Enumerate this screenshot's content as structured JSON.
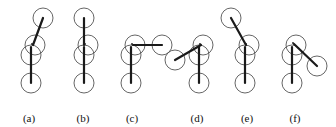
{
  "figure": {
    "kind": "multi-panel-line-diagram",
    "background_color": "#ffffff",
    "stroke_color": "#1a1a1a",
    "circle_stroke_color": "#555555",
    "circle_fill": "none",
    "width": 336,
    "height": 127,
    "label_row_y": 112,
    "circle_radius": 10,
    "link_stroke_width": 2.2,
    "circle_stroke_width": 0.9,
    "joint_dot_radius": 0.9,
    "panels": [
      {
        "label": "(a)",
        "label_x": 22,
        "distal_direction_label": "upper-right",
        "distal_angle_deg": 62,
        "base_circle": {
          "cx": 31,
          "cy": 83,
          "r": 10
        },
        "mid_lower_circle": {
          "cx": 31,
          "cy": 55,
          "r": 10
        },
        "mid_upper_circle": {
          "cx": 35,
          "cy": 45,
          "r": 10
        },
        "distal_circle": {
          "cx": 43,
          "cy": 18,
          "r": 10
        },
        "links": [
          {
            "x1": 31,
            "y1": 83,
            "x2": 31,
            "y2": 47
          },
          {
            "x1": 33,
            "y1": 45,
            "x2": 43,
            "y2": 18
          }
        ],
        "joint_dot": {
          "cx": 32,
          "cy": 44
        }
      },
      {
        "label": "(b)",
        "label_x": 76,
        "distal_direction_label": "straight-up",
        "distal_angle_deg": 90,
        "base_circle": {
          "cx": 84,
          "cy": 83,
          "r": 10
        },
        "mid_lower_circle": {
          "cx": 84,
          "cy": 55,
          "r": 10
        },
        "mid_upper_circle": {
          "cx": 88,
          "cy": 45,
          "r": 10
        },
        "distal_circle": {
          "cx": 84,
          "cy": 18,
          "r": 10
        },
        "links": [
          {
            "x1": 84,
            "y1": 83,
            "x2": 84,
            "y2": 47
          },
          {
            "x1": 84,
            "y1": 45,
            "x2": 84,
            "y2": 18
          }
        ],
        "joint_dot": {
          "cx": 85,
          "cy": 44
        }
      },
      {
        "label": "(c)",
        "label_x": 125,
        "distal_direction_label": "horizontal-right",
        "distal_angle_deg": 0,
        "base_circle": {
          "cx": 131,
          "cy": 83,
          "r": 10
        },
        "mid_lower_circle": {
          "cx": 131,
          "cy": 55,
          "r": 10
        },
        "mid_upper_circle": {
          "cx": 135,
          "cy": 45,
          "r": 10
        },
        "distal_circle": {
          "cx": 162,
          "cy": 45,
          "r": 10
        },
        "links": [
          {
            "x1": 131,
            "y1": 83,
            "x2": 131,
            "y2": 47
          },
          {
            "x1": 133,
            "y1": 45,
            "x2": 162,
            "y2": 45
          }
        ],
        "joint_dot": {
          "cx": 132,
          "cy": 44
        }
      },
      {
        "label": "(d)",
        "label_x": 190,
        "distal_direction_label": "lower-left",
        "distal_angle_deg": 205,
        "base_circle": {
          "cx": 199,
          "cy": 83,
          "r": 10
        },
        "mid_lower_circle": {
          "cx": 199,
          "cy": 55,
          "r": 10
        },
        "mid_upper_circle": {
          "cx": 203,
          "cy": 45,
          "r": 10
        },
        "distal_circle": {
          "cx": 175,
          "cy": 60,
          "r": 10
        },
        "links": [
          {
            "x1": 199,
            "y1": 83,
            "x2": 199,
            "y2": 47
          },
          {
            "x1": 201,
            "y1": 45,
            "x2": 175,
            "y2": 60
          }
        ],
        "joint_dot": {
          "cx": 200,
          "cy": 44
        }
      },
      {
        "label": "(e)",
        "label_x": 240,
        "distal_direction_label": "upper-left",
        "distal_angle_deg": 118,
        "base_circle": {
          "cx": 245,
          "cy": 83,
          "r": 10
        },
        "mid_lower_circle": {
          "cx": 245,
          "cy": 55,
          "r": 10
        },
        "mid_upper_circle": {
          "cx": 249,
          "cy": 45,
          "r": 10
        },
        "distal_circle": {
          "cx": 231,
          "cy": 18,
          "r": 10
        },
        "links": [
          {
            "x1": 245,
            "y1": 83,
            "x2": 245,
            "y2": 47
          },
          {
            "x1": 246,
            "y1": 45,
            "x2": 231,
            "y2": 18
          }
        ],
        "joint_dot": {
          "cx": 246,
          "cy": 44
        }
      },
      {
        "label": "(f)",
        "label_x": 288,
        "distal_direction_label": "lower-right",
        "distal_angle_deg": -40,
        "base_circle": {
          "cx": 292,
          "cy": 83,
          "r": 10
        },
        "mid_lower_circle": {
          "cx": 292,
          "cy": 55,
          "r": 10
        },
        "mid_upper_circle": {
          "cx": 296,
          "cy": 45,
          "r": 10
        },
        "distal_circle": {
          "cx": 317,
          "cy": 66,
          "r": 10
        },
        "links": [
          {
            "x1": 292,
            "y1": 83,
            "x2": 292,
            "y2": 47
          },
          {
            "x1": 294,
            "y1": 44,
            "x2": 317,
            "y2": 66
          }
        ],
        "joint_dot": {
          "cx": 293,
          "cy": 43
        }
      }
    ]
  }
}
